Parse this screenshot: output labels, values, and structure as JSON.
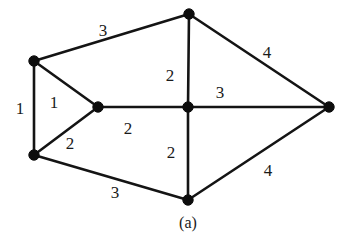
{
  "figure": {
    "caption": "(a)",
    "caption_x": 188,
    "caption_y": 223,
    "background_color": "#ffffff",
    "line_color": "#141414",
    "node_color": "#0d0d0d",
    "text_color": "#1a1a1a"
  },
  "chart_data": {
    "type": "diagram",
    "subtype": "weighted-undirected-graph",
    "title": "(a)",
    "xlabel": "",
    "ylabel": "",
    "grid": false,
    "legend": null,
    "nodes": [
      {
        "id": "top-left",
        "label": "",
        "x": 34,
        "y": 61
      },
      {
        "id": "bottom-left",
        "label": "",
        "x": 34,
        "y": 155
      },
      {
        "id": "middle-left",
        "label": "",
        "x": 98,
        "y": 107
      },
      {
        "id": "top-center",
        "label": "",
        "x": 189,
        "y": 14
      },
      {
        "id": "center",
        "label": "",
        "x": 188,
        "y": 107
      },
      {
        "id": "bottom-center",
        "label": "",
        "x": 188,
        "y": 200
      },
      {
        "id": "right",
        "label": "",
        "x": 329,
        "y": 107
      }
    ],
    "edges": [
      {
        "id": "e-tl-bl",
        "source": "top-left",
        "target": "bottom-left",
        "weight": 1,
        "label": "1",
        "label_x": 20,
        "label_y": 108
      },
      {
        "id": "e-tl-ml",
        "source": "top-left",
        "target": "middle-left",
        "weight": 1,
        "label": "1",
        "label_x": 54,
        "label_y": 102
      },
      {
        "id": "e-bl-ml",
        "source": "bottom-left",
        "target": "middle-left",
        "weight": 2,
        "label": "2",
        "label_x": 70,
        "label_y": 143
      },
      {
        "id": "e-tl-tc",
        "source": "top-left",
        "target": "top-center",
        "weight": 3,
        "label": "3",
        "label_x": 103,
        "label_y": 30
      },
      {
        "id": "e-tc-r",
        "source": "top-center",
        "target": "right",
        "weight": 4,
        "label": "4",
        "label_x": 267,
        "label_y": 52
      },
      {
        "id": "e-tc-c",
        "source": "top-center",
        "target": "center",
        "weight": 2,
        "label": "2",
        "label_x": 170,
        "label_y": 75
      },
      {
        "id": "e-ml-c",
        "source": "middle-left",
        "target": "center",
        "weight": 2,
        "label": "2",
        "label_x": 128,
        "label_y": 128
      },
      {
        "id": "e-c-r",
        "source": "center",
        "target": "right",
        "weight": 3,
        "label": "3",
        "label_x": 220,
        "label_y": 92
      },
      {
        "id": "e-c-bc",
        "source": "center",
        "target": "bottom-center",
        "weight": 2,
        "label": "2",
        "label_x": 171,
        "label_y": 152
      },
      {
        "id": "e-bl-bc",
        "source": "bottom-left",
        "target": "bottom-center",
        "weight": 3,
        "label": "3",
        "label_x": 115,
        "label_y": 192
      },
      {
        "id": "e-bc-r",
        "source": "bottom-center",
        "target": "right",
        "weight": 4,
        "label": "4",
        "label_x": 268,
        "label_y": 170
      }
    ],
    "node_radius": 5.2
  }
}
